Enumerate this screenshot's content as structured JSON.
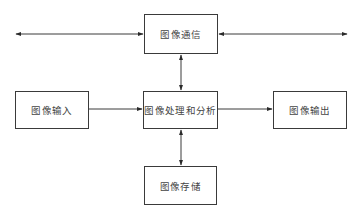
{
  "diagram": {
    "nodes": {
      "communication": "图像通信",
      "input": "图像输入",
      "processing": "图像处理和分析",
      "output": "图像输出",
      "storage": "图像存储"
    },
    "edges": [
      {
        "from": "external-left",
        "to": "communication",
        "direction": "bidirectional"
      },
      {
        "from": "communication",
        "to": "external-right",
        "direction": "bidirectional"
      },
      {
        "from": "communication",
        "to": "processing",
        "direction": "bidirectional"
      },
      {
        "from": "input",
        "to": "processing",
        "direction": "forward"
      },
      {
        "from": "processing",
        "to": "output",
        "direction": "forward"
      },
      {
        "from": "processing",
        "to": "storage",
        "direction": "bidirectional"
      }
    ],
    "colors": {
      "line": "#3a3a3a",
      "text": "#444444",
      "background": "#ffffff"
    }
  }
}
